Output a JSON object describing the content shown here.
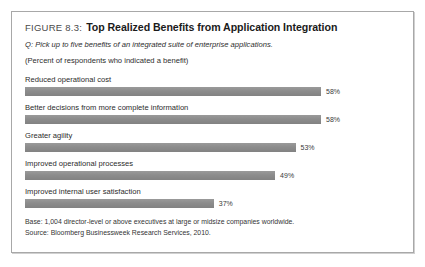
{
  "figure": {
    "label": "FIGURE 8.3:",
    "title": "Top Realized Benefits from Application Integration",
    "question": "Q: Pick up to five benefits of an integrated suite of enterprise applications.",
    "unit_note": "(Percent of respondents who indicated a benefit)",
    "base_note": "Base: 1,004 director-level or above executives at large or midsize companies worldwide.",
    "source_note": "Source: Bloomberg Businessweek Research Services, 2010."
  },
  "colors": {
    "bar": "#8c8c8c",
    "frame_border": "#a8a8a8",
    "text": "#2b2b2b"
  },
  "chart_data": {
    "type": "bar",
    "orientation": "horizontal",
    "title": "Top Realized Benefits from Application Integration",
    "subtitle": "Q: Pick up to five benefits of an integrated suite of enterprise applications.",
    "xlabel": "Percent of respondents who indicated a benefit",
    "ylabel": "",
    "xlim": [
      0,
      70
    ],
    "grid": false,
    "legend": false,
    "categories": [
      "Reduced operational cost",
      "Better decisions from more complete information",
      "Greater agility",
      "Improved operational processes",
      "Improved internal user satisfaction"
    ],
    "values": [
      58,
      58,
      53,
      49,
      37
    ],
    "value_labels": [
      "58%",
      "58%",
      "53%",
      "49%",
      "37%"
    ],
    "bars": [
      {
        "category": "Reduced operational cost",
        "value": 58,
        "label": "58%"
      },
      {
        "category": "Better decisions from more complete information",
        "value": 58,
        "label": "58%"
      },
      {
        "category": "Greater agility",
        "value": 53,
        "label": "53%"
      },
      {
        "category": "Improved operational processes",
        "value": 49,
        "label": "49%"
      },
      {
        "category": "Improved internal user satisfaction",
        "value": 37,
        "label": "37%"
      }
    ]
  }
}
